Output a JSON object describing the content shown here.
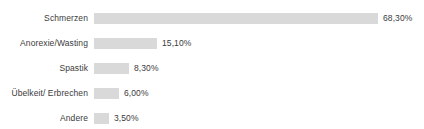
{
  "chart_data": {
    "type": "bar",
    "orientation": "horizontal",
    "title": "",
    "subtitle": "",
    "xlabel": "",
    "ylabel": "",
    "xlim": [
      0,
      68.3
    ],
    "grid": false,
    "legend": false,
    "legend_position": "none",
    "value_suffix": "%",
    "decimal_separator": ",",
    "categories": [
      "Schmerzen",
      "Anorexie/Wasting",
      "Spastik",
      "Übelkeit/ Erbrechen",
      "Andere"
    ],
    "values": [
      68.3,
      15.1,
      8.3,
      6.0,
      3.5
    ],
    "value_labels": [
      "68,30%",
      "15,10%",
      "8,30%",
      "6,00%",
      "3,50%"
    ],
    "bars": [
      {
        "category": "Schmerzen",
        "value": 68.3,
        "value_label": "68,30%",
        "bar_px": 284
      },
      {
        "category": "Anorexie/Wasting",
        "value": 15.1,
        "value_label": "15,10%",
        "bar_px": 63
      },
      {
        "category": "Spastik",
        "value": 8.3,
        "value_label": "8,30%",
        "bar_px": 35
      },
      {
        "category": "Übelkeit/ Erbrechen",
        "value": 6.0,
        "value_label": "6,00%",
        "bar_px": 25
      },
      {
        "category": "Andere",
        "value": 3.5,
        "value_label": "3,50%",
        "bar_px": 15
      }
    ],
    "colors": {
      "bar_fill": "#d9d9d9",
      "text": "#3b3b3b",
      "background": "#ffffff"
    }
  }
}
